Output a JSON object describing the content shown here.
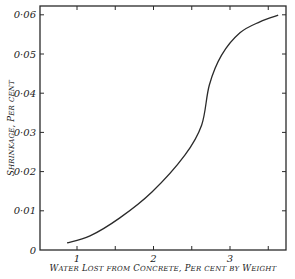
{
  "chart_data": {
    "type": "line",
    "title": "",
    "xlabel": "Water Lost from Concrete, Per cent by Weight",
    "ylabel": "Shrinkage, Per cent",
    "xlim": [
      0.52,
      3.75
    ],
    "ylim": [
      0,
      0.062
    ],
    "x_ticks": [
      1,
      1.5,
      2,
      2.5,
      3,
      3.5
    ],
    "x_tick_labels": [
      "1",
      "",
      "2",
      "",
      "3",
      ""
    ],
    "y_ticks": [
      0,
      0.01,
      0.02,
      0.03,
      0.04,
      0.05,
      0.06
    ],
    "y_tick_labels": [
      "0",
      "0·01",
      "0·02",
      "0·03",
      "0·04",
      "0·05",
      "0·06"
    ],
    "grid": false,
    "legend": null,
    "series": [
      {
        "name": "Shrinkage",
        "x": [
          0.87,
          1.17,
          1.56,
          1.98,
          2.41,
          2.63,
          2.73,
          2.89,
          3.13,
          3.39,
          3.63
        ],
        "y": [
          0.0018,
          0.0036,
          0.0082,
          0.0148,
          0.0242,
          0.0319,
          0.0421,
          0.0497,
          0.0554,
          0.0582,
          0.0599
        ]
      }
    ]
  },
  "axes": {
    "x_title": "Water Lost from Concrete, Per cent by Weight",
    "y_title": "Shrinkage, Per cent"
  }
}
